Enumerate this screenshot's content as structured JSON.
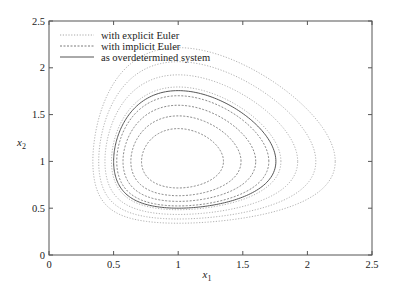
{
  "chart_data": {
    "type": "line",
    "title": "",
    "xlabel": "x",
    "xlabel_sub": "1",
    "ylabel": "x",
    "ylabel_sub": "2",
    "xlim": [
      0,
      2.5
    ],
    "ylim": [
      0,
      2.5
    ],
    "xticks": [
      0,
      0.5,
      1,
      1.5,
      2,
      2.5
    ],
    "xtick_labels": [
      "0",
      "0.5",
      "1",
      "1.5",
      "2",
      "2.5"
    ],
    "yticks": [
      0,
      0.5,
      1,
      1.5,
      2,
      2.5
    ],
    "ytick_labels": [
      "0",
      "0.5",
      "1",
      "1.5",
      "2",
      "2.5"
    ],
    "grid": false,
    "legend_position": "top-left",
    "series": [
      {
        "name": "with explicit Euler",
        "style": "dotted",
        "color": "#a8a8a8",
        "behavior": "spirals outward",
        "loop_levels_H": [
          2.21,
          2.27,
          2.34,
          2.42
        ],
        "approx_extent": {
          "x1": [
            0.42,
            1.9
          ],
          "x2": [
            0.45,
            1.92
          ]
        }
      },
      {
        "name": "with implicit Euler",
        "style": "dashed",
        "color": "#7a7a7a",
        "behavior": "spirals inward",
        "loop_levels_H": [
          2.17,
          2.13,
          2.09,
          2.05
        ],
        "approx_extent": {
          "x1": [
            0.59,
            1.68
          ],
          "x2": [
            0.55,
            1.66
          ]
        }
      },
      {
        "name": "as overdetermined system",
        "style": "solid",
        "color": "#555555",
        "behavior": "closed orbit",
        "loop_levels_H": [
          2.193
        ],
        "approx_extent": {
          "x1": [
            0.5,
            1.75
          ],
          "x2": [
            0.5,
            1.74
          ]
        }
      }
    ]
  }
}
